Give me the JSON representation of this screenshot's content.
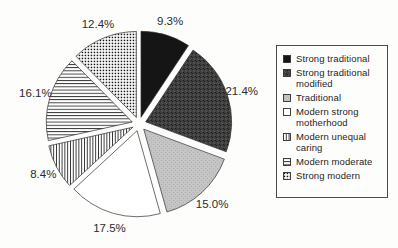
{
  "chart_data": {
    "type": "pie",
    "exploded": true,
    "start_angle_deg": 0,
    "clockwise": true,
    "legend_position": "right",
    "slices": [
      {
        "label": "Strong traditional",
        "value": 9.3,
        "display": "9.3%",
        "pattern": "solid-black"
      },
      {
        "label": "Strong traditional modified",
        "value": 21.4,
        "display": "21.4%",
        "pattern": "dark-speckle"
      },
      {
        "label": "Traditional",
        "value": 15.0,
        "display": "15.0%",
        "pattern": "light-gray"
      },
      {
        "label": "Modern strong motherhood",
        "value": 17.5,
        "display": "17.5%",
        "pattern": "white"
      },
      {
        "label": "Modern unequal caring",
        "value": 8.4,
        "display": "8.4%",
        "pattern": "vertical-lines"
      },
      {
        "label": "Modern moderate",
        "value": 16.1,
        "display": "16.1%",
        "pattern": "horizontal-lines"
      },
      {
        "label": "Strong modern",
        "value": 12.4,
        "display": "12.4%",
        "pattern": "dot-grid"
      }
    ]
  },
  "colors": {
    "background": "#fdfdfc",
    "label_ink": "#2b2b2b",
    "outline": "#2f2f2f",
    "slice_black": "#151515",
    "slice_dark_base": "#3f3f3f",
    "slice_dark_speck_dark": "#1c1c1c",
    "slice_dark_speck_light": "#585858",
    "slice_light_base": "#c4c4c4",
    "slice_light_speck": "#b0b0b0",
    "slice_white": "#ffffff",
    "hatch_ink": "#2b2b2b",
    "legend_border": "#4a4a4a"
  }
}
